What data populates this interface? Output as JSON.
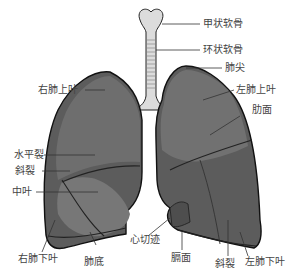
{
  "colors": {
    "lung_dark": "#5a5a5a",
    "lung_mid": "#6e6e6e",
    "lung_light": "#8a8a8a",
    "outline": "#1a1a1a",
    "trachea": "#dcdcdc",
    "leader": "#333333",
    "label_text": "#444444"
  },
  "labels": {
    "thyroid_cartilage": "甲状软骨",
    "cricoid_cartilage": "环状软骨",
    "apex": "肺尖",
    "right_upper_lobe": "右肺上叶",
    "left_upper_lobe": "左肺上叶",
    "costal_surface": "肋面",
    "horizontal_fissure": "水平裂",
    "oblique_fissure_right": "斜裂",
    "middle_lobe": "中叶",
    "right_lower_lobe": "右肺下叶",
    "base": "肺底",
    "cardiac_notch": "心切迹",
    "diaphragmatic_surface": "膈面",
    "oblique_fissure_left": "斜裂",
    "left_lower_lobe": "左肺下叶"
  }
}
